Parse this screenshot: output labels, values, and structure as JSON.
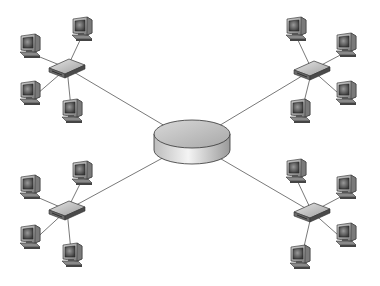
{
  "diagram": {
    "type": "hierarchical-star-network",
    "background": "#ffffff",
    "line_color": "#6a6a6a",
    "hub": {
      "name": "central-hub",
      "cx": 192,
      "cy": 134,
      "rx": 38,
      "ry": 14,
      "depth": 16
    },
    "segments": [
      {
        "name": "top-left",
        "switch": {
          "x": 67,
          "y": 68
        },
        "computers": [
          {
            "x": 30,
            "y": 45
          },
          {
            "x": 82,
            "y": 28
          },
          {
            "x": 30,
            "y": 92
          },
          {
            "x": 72,
            "y": 110
          }
        ]
      },
      {
        "name": "top-right",
        "switch": {
          "x": 312,
          "y": 70
        },
        "computers": [
          {
            "x": 296,
            "y": 28
          },
          {
            "x": 346,
            "y": 44
          },
          {
            "x": 346,
            "y": 92
          },
          {
            "x": 300,
            "y": 110
          }
        ]
      },
      {
        "name": "bottom-left",
        "switch": {
          "x": 67,
          "y": 210
        },
        "computers": [
          {
            "x": 30,
            "y": 186
          },
          {
            "x": 82,
            "y": 172
          },
          {
            "x": 30,
            "y": 236
          },
          {
            "x": 72,
            "y": 254
          }
        ]
      },
      {
        "name": "bottom-right",
        "switch": {
          "x": 312,
          "y": 212
        },
        "computers": [
          {
            "x": 296,
            "y": 170
          },
          {
            "x": 346,
            "y": 186
          },
          {
            "x": 346,
            "y": 234
          },
          {
            "x": 300,
            "y": 256
          }
        ]
      }
    ]
  }
}
